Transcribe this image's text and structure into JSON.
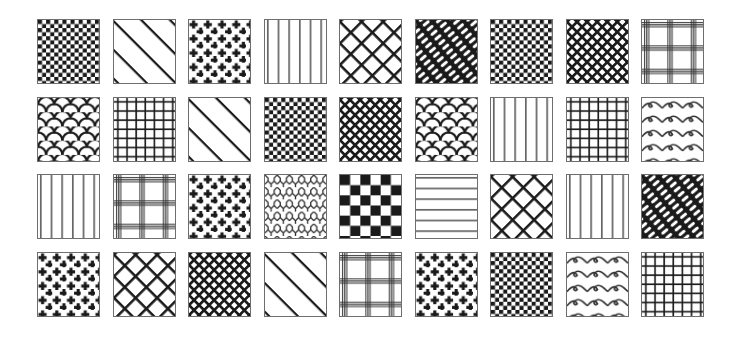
{
  "grid": {
    "columns": 9,
    "rows": 4
  },
  "colors": {
    "ink": "#1a1a1a",
    "border": "#6e6e6e",
    "background": "#ffffff"
  },
  "tiles": [
    [
      "checker-small",
      "diagonal-wide",
      "crosses",
      "vertical-lines",
      "diamond-lattice",
      "diagonal-bricks",
      "checker-small",
      "diamond-lattice-dense",
      "plaid"
    ],
    [
      "scales",
      "grid-lines",
      "diagonal-wide",
      "checker-small",
      "diamond-lattice-dense",
      "scales",
      "vertical-lines",
      "grid-lines",
      "waves"
    ],
    [
      "vertical-lines",
      "plaid",
      "crosses",
      "chain-link",
      "checker-large",
      "horizontal-lines",
      "diamond-lattice",
      "vertical-lines",
      "diagonal-bricks"
    ],
    [
      "crosses",
      "diamond-lattice",
      "diamond-lattice-dense",
      "diagonal-wide",
      "plaid",
      "crosses",
      "checker-small",
      "waves",
      "grid-lines"
    ]
  ]
}
